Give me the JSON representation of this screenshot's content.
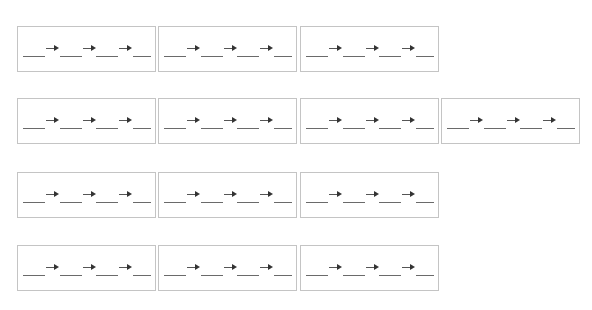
{
  "worksheet": {
    "description": "Fill-in-the-blank sequence boxes: blank → blank → blank → blank",
    "border_color": "#c4c4c4",
    "line_color": "#6a6a6a",
    "arrow_glyph": "→",
    "rows": [
      {
        "boxes": 3,
        "top": 26
      },
      {
        "boxes": 4,
        "top": 98
      },
      {
        "boxes": 3,
        "top": 172
      },
      {
        "boxes": 3,
        "top": 245
      }
    ],
    "box_lefts": [
      17,
      158,
      300,
      441
    ],
    "blanks_per_box": 4,
    "arrows_per_box": 3
  }
}
